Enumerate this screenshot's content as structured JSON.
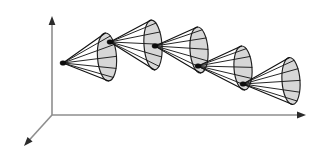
{
  "figure": {
    "name": "nested-cone-chain-diagram",
    "width": 329,
    "height": 163,
    "background_color": "#ffffff"
  },
  "colors": {
    "background": "#ffffff",
    "axis_line": "#8e8e8e",
    "axis_arrow": "#2b2b2b",
    "cone_fill": "#d7d7d7",
    "cone_stroke": "#202020",
    "ray_stroke": "#1a1a1a",
    "apex_dot": "#0d0d0d"
  },
  "axes": {
    "origin": {
      "x": 52,
      "y": 115
    },
    "items": [
      {
        "id": "y-axis",
        "label": "",
        "direction": "up",
        "from": {
          "x": 52,
          "y": 115
        },
        "to": {
          "x": 52,
          "y": 16
        },
        "arrow": true
      },
      {
        "id": "x-axis",
        "label": "",
        "direction": "right",
        "from": {
          "x": 52,
          "y": 115
        },
        "to": {
          "x": 306,
          "y": 115
        },
        "arrow": true
      },
      {
        "id": "z-axis",
        "label": "",
        "direction": "down-left",
        "from": {
          "x": 52,
          "y": 115
        },
        "to": {
          "x": 24,
          "y": 146
        },
        "arrow": true
      }
    ]
  },
  "cones": [
    {
      "id": "cone-1",
      "apex": {
        "x": 63,
        "y": 63
      },
      "base_center": {
        "x": 107,
        "y": 57
      },
      "base_rx": 9.5,
      "base_ry": 24.0,
      "base_tilt_deg": -4,
      "ray_count": 5,
      "apex_dot": true
    },
    {
      "id": "cone-2",
      "apex": {
        "x": 110,
        "y": 42
      },
      "base_center": {
        "x": 153,
        "y": 45
      },
      "base_rx": 9.0,
      "base_ry": 25.0,
      "base_tilt_deg": -4,
      "ray_count": 5,
      "apex_dot": true
    },
    {
      "id": "cone-3",
      "apex": {
        "x": 155,
        "y": 46
      },
      "base_center": {
        "x": 199,
        "y": 50
      },
      "base_rx": 9.0,
      "base_ry": 23.0,
      "base_tilt_deg": -4,
      "ray_count": 5,
      "apex_dot": true
    },
    {
      "id": "cone-4",
      "apex": {
        "x": 198,
        "y": 66
      },
      "base_center": {
        "x": 243,
        "y": 68
      },
      "base_rx": 9.0,
      "base_ry": 22.0,
      "base_tilt_deg": -4,
      "ray_count": 5,
      "apex_dot": true
    },
    {
      "id": "cone-5",
      "apex": {
        "x": 243,
        "y": 84
      },
      "base_center": {
        "x": 291,
        "y": 81
      },
      "base_rx": 9.0,
      "base_ry": 23.5,
      "base_tilt_deg": -4,
      "ray_count": 5,
      "apex_dot": true
    }
  ]
}
